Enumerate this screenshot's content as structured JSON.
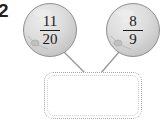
{
  "problem": {
    "number": "2"
  },
  "nodes": [
    {
      "id": "node-left",
      "shape": "sphere",
      "numerator": "11",
      "denominator": "20"
    },
    {
      "id": "node-right",
      "shape": "sphere",
      "numerator": "8",
      "denominator": "9"
    }
  ],
  "answer_box": {
    "value": "",
    "border_style": "dotted"
  },
  "colors": {
    "sphere_fill": "#d6d6d6",
    "sphere_edge": "#8f8f8f",
    "sphere_highlight": "#e9e9e9",
    "connector": "#9a9a9a",
    "box_border": "#a8a8a8",
    "text": "#1a1a1a",
    "number_text": "#231f20",
    "background": "#ffffff"
  }
}
